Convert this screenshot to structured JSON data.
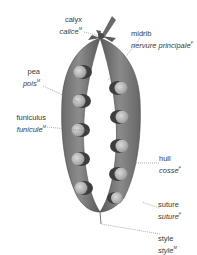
{
  "diagram": {
    "labels": [
      {
        "id": "calyx",
        "en": "calyx",
        "fr": "calice",
        "fr_gender": "M"
      },
      {
        "id": "midrib",
        "en": "midrib",
        "fr": "nervure principale",
        "fr_gender": "F"
      },
      {
        "id": "pea",
        "en": "pea",
        "fr": "pois",
        "fr_gender": "M"
      },
      {
        "id": "funiculus",
        "en": "funiculus",
        "fr": "funicule",
        "fr_gender": "M"
      },
      {
        "id": "hull",
        "en": "hull",
        "fr": "cosse",
        "fr_gender": "F"
      },
      {
        "id": "suture",
        "en": "suture",
        "fr": "suture",
        "fr_gender": "F"
      },
      {
        "id": "style",
        "en": "style",
        "fr": "style",
        "fr_gender": "M"
      }
    ],
    "colors": {
      "pod_dark": "#5f5f5f",
      "pod_mid": "#808080",
      "pod_light": "#a8a8a8",
      "pea": "#b5b5b5",
      "leader": "#777777",
      "text": "#3a3a3a"
    }
  }
}
